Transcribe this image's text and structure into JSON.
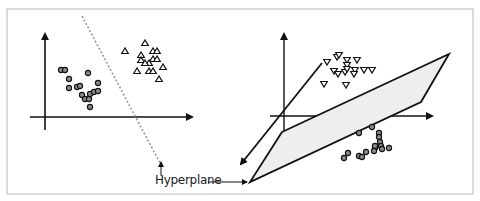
{
  "figure": {
    "frame": {
      "x": 7,
      "y": 9,
      "w": 466,
      "h": 185,
      "stroke": "#b8b8b8"
    },
    "colors": {
      "ink": "#111111",
      "circle_fill": "#8a8a8a",
      "plane_fill": "#eeeeee",
      "dashed_line": "#9a9a9a"
    }
  },
  "panel_2d": {
    "axes": {
      "y_axis": {
        "x": 45,
        "y_top": 34,
        "y_bottom": 130
      },
      "x_axis": {
        "y": 117,
        "x_left": 30,
        "x_right": 192
      }
    },
    "circles": [
      [
        61,
        70
      ],
      [
        65,
        70
      ],
      [
        69,
        79
      ],
      [
        69,
        88
      ],
      [
        77,
        87
      ],
      [
        80,
        86
      ],
      [
        88,
        73
      ],
      [
        82,
        95
      ],
      [
        85,
        99
      ],
      [
        89,
        99
      ],
      [
        90,
        94
      ],
      [
        94,
        92
      ],
      [
        98,
        91
      ],
      [
        98,
        83
      ],
      [
        90,
        107
      ]
    ],
    "triangles": [
      [
        125,
        51
      ],
      [
        145,
        43
      ],
      [
        141,
        55
      ],
      [
        153,
        51
      ],
      [
        157,
        51
      ],
      [
        141,
        60
      ],
      [
        153,
        59
      ],
      [
        157,
        59
      ],
      [
        149,
        63
      ],
      [
        145,
        63
      ],
      [
        137,
        71
      ],
      [
        149,
        71
      ],
      [
        153,
        71
      ],
      [
        163,
        67
      ],
      [
        159,
        79
      ]
    ],
    "separator": {
      "x1": 82,
      "y1": 16,
      "x2": 160,
      "y2": 163,
      "style": "dashed"
    }
  },
  "panel_3d": {
    "axes": {
      "origin": [
        284,
        116
      ],
      "vertical": {
        "x": 284,
        "y_top": 34,
        "y_bottom": 132
      },
      "horizontal": {
        "y": 116,
        "x_left": 270,
        "x_right": 432
      },
      "depth": {
        "x1": 322,
        "y1": 63,
        "x2": 241,
        "y2": 164
      }
    },
    "plane": [
      [
        282,
        132
      ],
      [
        449,
        54
      ],
      [
        421,
        102
      ],
      [
        250,
        182
      ]
    ],
    "triangles_down": [
      [
        327,
        62
      ],
      [
        337,
        57
      ],
      [
        339,
        55
      ],
      [
        347,
        60
      ],
      [
        357,
        60
      ],
      [
        355,
        70
      ],
      [
        334,
        71
      ],
      [
        338,
        74
      ],
      [
        345,
        72
      ],
      [
        347,
        65
      ],
      [
        347,
        69
      ],
      [
        354,
        74
      ],
      [
        364,
        70
      ],
      [
        372,
        70
      ],
      [
        324,
        84
      ],
      [
        346,
        85
      ]
    ],
    "circles": [
      [
        359,
        133
      ],
      [
        372,
        127
      ],
      [
        379,
        133
      ],
      [
        379,
        137
      ],
      [
        380,
        142
      ],
      [
        381,
        146
      ],
      [
        382,
        149
      ],
      [
        366,
        152
      ],
      [
        359,
        156
      ],
      [
        375,
        148
      ],
      [
        375,
        146
      ],
      [
        374,
        151
      ],
      [
        389,
        148
      ],
      [
        348,
        153
      ],
      [
        344,
        158
      ],
      [
        362,
        157
      ]
    ]
  },
  "annotations": {
    "hyperplane_label": "Hyperplane",
    "label_pos": {
      "x": 155,
      "y": 173
    },
    "arrow_2d": {
      "x": 161,
      "y_from": 176,
      "y_to": 162
    },
    "arrow_3d": {
      "x_from": 208,
      "x_to": 247,
      "y": 182
    }
  }
}
